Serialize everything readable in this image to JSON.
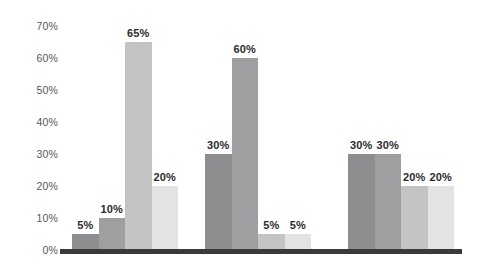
{
  "chart_data": {
    "type": "bar",
    "title": "",
    "subtitle": "",
    "xlabel": "",
    "ylabel": "",
    "categories": [
      "Group 1",
      "Group 2",
      "Group 3"
    ],
    "ylim": [
      0,
      70
    ],
    "y_ticks": [
      "0%",
      "10%",
      "20%",
      "30%",
      "40%",
      "50%",
      "60%",
      "70%"
    ],
    "y_tick_values": [
      0,
      10,
      20,
      30,
      40,
      50,
      60,
      70
    ],
    "grid": false,
    "legend": "none",
    "series": [
      {
        "name": "Series 1",
        "values": [
          5,
          30,
          30
        ],
        "labels": [
          "5%",
          "30%",
          "30%"
        ],
        "color": "#8e8e90"
      },
      {
        "name": "Series 2",
        "values": [
          10,
          60,
          30
        ],
        "labels": [
          "10%",
          "60%",
          "30%"
        ],
        "color": "#9f9fa1"
      },
      {
        "name": "Series 3",
        "values": [
          65,
          5,
          20
        ],
        "labels": [
          "65%",
          "5%",
          "20%"
        ],
        "color": "#c4c4c5"
      },
      {
        "name": "Series 4",
        "values": [
          20,
          5,
          20
        ],
        "labels": [
          "20%",
          "5%",
          "20%"
        ],
        "color": "#e3e3e3"
      }
    ],
    "groups": [
      {
        "name": "Group 1",
        "bars": [
          {
            "label": "5%",
            "value": 5,
            "color": "#8e8e90"
          },
          {
            "label": "10%",
            "value": 10,
            "color": "#9f9fa1"
          },
          {
            "label": "65%",
            "value": 65,
            "color": "#c4c4c5"
          },
          {
            "label": "20%",
            "value": 20,
            "color": "#e3e3e3"
          }
        ]
      },
      {
        "name": "Group 2",
        "bars": [
          {
            "label": "30%",
            "value": 30,
            "color": "#8e8e90"
          },
          {
            "label": "60%",
            "value": 60,
            "color": "#9f9fa1"
          },
          {
            "label": "5%",
            "value": 5,
            "color": "#c4c4c5"
          },
          {
            "label": "5%",
            "value": 5,
            "color": "#e3e3e3"
          }
        ]
      },
      {
        "name": "Group 3",
        "bars": [
          {
            "label": "30%",
            "value": 30,
            "color": "#8e8e90"
          },
          {
            "label": "30%",
            "value": 30,
            "color": "#9f9fa1"
          },
          {
            "label": "20%",
            "value": 20,
            "color": "#c4c4c5"
          },
          {
            "label": "20%",
            "value": 20,
            "color": "#e3e3e3"
          }
        ]
      }
    ],
    "colors": {
      "background": "#ffffff",
      "baseline": "#3a3a3c",
      "axis_label": "#58585a",
      "data_label": "#2b2b2d"
    }
  },
  "layout": {
    "group_positions": [
      {
        "left": 12,
        "width": 106
      },
      {
        "left": 145,
        "width": 106
      },
      {
        "left": 288,
        "width": 106
      }
    ],
    "bar_width": 26.5
  }
}
